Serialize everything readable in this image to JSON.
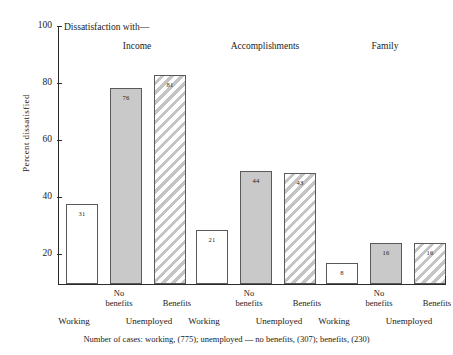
{
  "chart_data": {
    "type": "bar",
    "title": "Dissatisfaction with—",
    "xlabel": "",
    "ylabel": "Percent  dissatisfied",
    "ylim": [
      0,
      100
    ],
    "yticks": [
      20,
      40,
      60,
      80,
      100
    ],
    "grid": false,
    "legend": "none",
    "categories": [
      "Income",
      "Accomplishments",
      "Family"
    ],
    "series": [
      {
        "name": "Working",
        "fill": "white",
        "values": [
          31,
          21,
          8
        ]
      },
      {
        "name": "Unemployed — No benefits",
        "fill": "solid",
        "values": [
          76,
          44,
          16
        ]
      },
      {
        "name": "Unemployed — Benefits",
        "fill": "hatch",
        "values": [
          81,
          43,
          16
        ]
      }
    ],
    "groups": [
      {
        "label": "Income",
        "bars": [
          {
            "series": "Working",
            "value": 31,
            "label": "31",
            "fill": "white"
          },
          {
            "series": "Unemployed — No benefits",
            "value": 76,
            "label": "76",
            "fill": "solid"
          },
          {
            "series": "Unemployed — Benefits",
            "value": 81,
            "label": "81",
            "fill": "hatch"
          }
        ]
      },
      {
        "label": "Accomplishments",
        "bars": [
          {
            "series": "Working",
            "value": 21,
            "label": "21",
            "fill": "white"
          },
          {
            "series": "Unemployed — No benefits",
            "value": 44,
            "label": "44",
            "fill": "solid"
          },
          {
            "series": "Unemployed — Benefits",
            "value": 43,
            "label": "43",
            "fill": "hatch"
          }
        ]
      },
      {
        "label": "Family",
        "bars": [
          {
            "series": "Working",
            "value": 8,
            "label": "8",
            "fill": "white"
          },
          {
            "series": "Unemployed — No benefits",
            "value": 16,
            "label": "16",
            "fill": "solid"
          },
          {
            "series": "Unemployed — Benefits",
            "value": 16,
            "label": "16",
            "fill": "hatch"
          }
        ]
      }
    ],
    "annotations": {
      "footer": "Number of cases: working, (775); unemployed — no benefits, (307); benefits, (230)"
    }
  },
  "axis": {
    "y_title": "Percent  dissatisfied",
    "y_labels": {
      "t100": "100",
      "t80": "80",
      "t60": "60",
      "t40": "40",
      "t20": "20"
    }
  },
  "headers": {
    "series_caption": "Dissatisfaction with—",
    "group1": "Income",
    "group2": "Accomplishments",
    "group3": "Family"
  },
  "xlabels": {
    "upper": {
      "no_benefits": "No\nbenefits",
      "no_benefits_line1": "No",
      "no_benefits_line2": "benefits",
      "benefits": "Benefits"
    },
    "lower": {
      "working": "Working",
      "unemployed": "Unemployed"
    }
  },
  "values": {
    "income": {
      "working": "31",
      "no_benefits": "76",
      "benefits": "81"
    },
    "accomplishments": {
      "working": "21",
      "no_benefits": "44",
      "benefits": "43"
    },
    "family": {
      "working": "8",
      "no_benefits": "16",
      "benefits": "16"
    }
  },
  "footer": {
    "note": "Number of cases: working, (775); unemployed — no benefits, (307); benefits, (230)"
  },
  "colors": {
    "axis": "#2b2b2b",
    "bar_border": "#5a5a5a",
    "fill_solid": "#c9c9c9",
    "fill_hatch": "#c4c4c4",
    "background": "#ffffff"
  }
}
